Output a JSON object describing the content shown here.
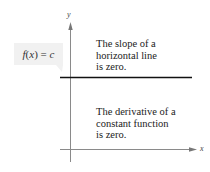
{
  "diagram": {
    "function_label": {
      "f": "f",
      "paren_open": "(",
      "x": "x",
      "paren_close": ")",
      "equals": " = ",
      "c": "c"
    },
    "axes": {
      "x_label": "x",
      "y_label": "y"
    },
    "upper_annotation": {
      "lines": [
        "The slope of a",
        "horizontal line",
        "is zero."
      ]
    },
    "lower_annotation": {
      "lines": [
        "The derivative of a",
        "constant function",
        "is zero."
      ]
    },
    "colors": {
      "axis": "#8a8a8a",
      "function_line": "#111111",
      "label_box_fill": "#f1f1f1",
      "text": "#222222"
    }
  }
}
